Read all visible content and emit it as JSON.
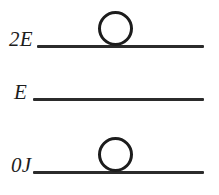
{
  "diagram": {
    "type": "energy-level-diagram",
    "background_color": "#ffffff",
    "line_color": "#2b2b2b",
    "label_color": "#1c1c1c",
    "levels": [
      {
        "id": "top",
        "label": "2E",
        "energy_value": "2E",
        "particle_count": 1
      },
      {
        "id": "middle",
        "label": "E",
        "energy_value": "E",
        "particle_count": 0
      },
      {
        "id": "bottom",
        "label": "0J",
        "energy_value": "0J",
        "particle_count": 1
      }
    ]
  }
}
